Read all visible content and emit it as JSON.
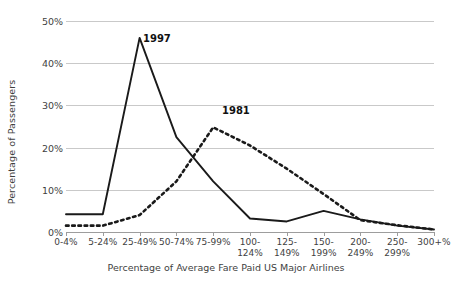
{
  "chart_data": {
    "type": "line",
    "title": "",
    "xlabel": "Percentage of Average Fare Paid US Major Airlines",
    "ylabel": "Percentage of Passengers",
    "categories": [
      "0-4%",
      "5-24%",
      "25-49%",
      "50-74%",
      "75-99%",
      "100-\n124%",
      "125-\n149%",
      "150-\n199%",
      "200-\n249%",
      "250-\n299%",
      "300+%"
    ],
    "ylim": [
      0,
      50
    ],
    "ytick_labels": [
      "0%",
      "10%",
      "20%",
      "30%",
      "40%",
      "50%"
    ],
    "ytick_values": [
      0,
      10,
      20,
      30,
      40,
      50
    ],
    "grid": "horizontal",
    "legend_position": "inline-annotations",
    "series": [
      {
        "name": "1997",
        "style": "solid",
        "color": "#1a1a1a",
        "label_text": "1997",
        "values": [
          4.2,
          4.2,
          46.0,
          22.5,
          12.0,
          3.2,
          2.5,
          5.0,
          3.0,
          1.5,
          0.6
        ]
      },
      {
        "name": "1981",
        "style": "dashed",
        "color": "#1a1a1a",
        "label_text": "1981",
        "values": [
          1.5,
          1.5,
          4.0,
          12.0,
          24.8,
          20.5,
          15.0,
          9.0,
          2.8,
          1.6,
          0.6
        ]
      }
    ]
  }
}
